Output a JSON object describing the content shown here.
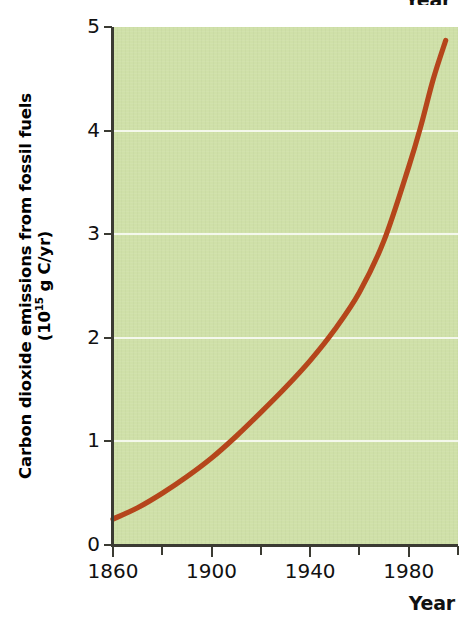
{
  "figure": {
    "top_cropped_label": "Year",
    "background_color": "#ffffff",
    "plot_background_color": "#cfe0a8",
    "gridline_color": "#f4f8ec",
    "axis_color": "#3b3b33",
    "curve_color": "#b5451b"
  },
  "axis_titles": {
    "y_line1": "Carbon dioxide emissions from fossil fuels",
    "y_line2_prefix": "(10",
    "y_line2_exponent": "15",
    "y_line2_suffix": " g C/yr)",
    "x": "Year"
  },
  "ticks": {
    "y_labels": [
      "0",
      "1",
      "2",
      "3",
      "4",
      "5"
    ],
    "x_major_labels": [
      "1860",
      "1900",
      "1940",
      "1980"
    ],
    "x_minor_years": [
      1880,
      1920,
      1960,
      2000
    ]
  },
  "chart_data": {
    "type": "line",
    "title": "",
    "xlabel": "Year",
    "ylabel": "Carbon dioxide emissions from fossil fuels (10^15 g C/yr)",
    "xlim": [
      1860,
      2000
    ],
    "ylim": [
      0,
      5
    ],
    "xticks": [
      1860,
      1900,
      1940,
      1980
    ],
    "yticks": [
      0,
      1,
      2,
      3,
      4,
      5
    ],
    "grid": "horizontal",
    "legend": "none",
    "series": [
      {
        "name": "Carbon dioxide emissions from fossil fuels",
        "color": "#b5451b",
        "x": [
          1860,
          1870,
          1880,
          1890,
          1900,
          1910,
          1920,
          1930,
          1940,
          1950,
          1960,
          1970,
          1980,
          1985,
          1990,
          1995
        ],
        "values": [
          0.25,
          0.36,
          0.5,
          0.66,
          0.84,
          1.05,
          1.28,
          1.52,
          1.78,
          2.08,
          2.44,
          2.94,
          3.65,
          4.05,
          4.5,
          4.87
        ]
      }
    ]
  }
}
